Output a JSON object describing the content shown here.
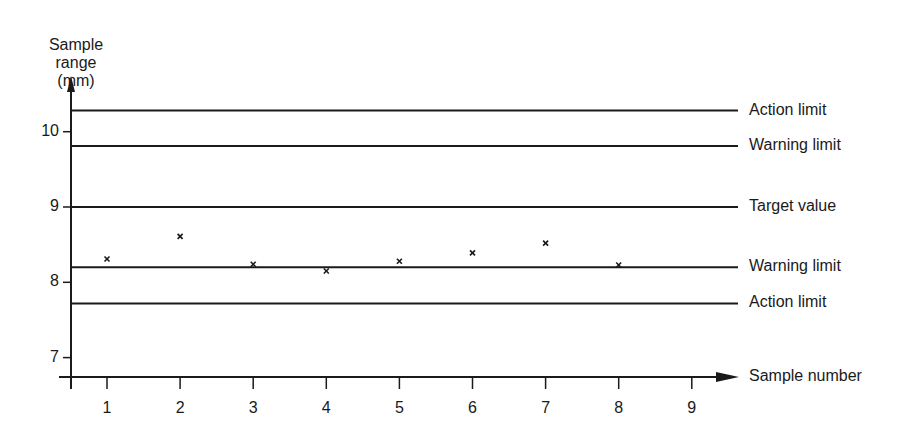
{
  "chart_data": {
    "type": "scatter",
    "title": "",
    "xlabel": "Sample number",
    "ylabel": "Sample range (mm)",
    "ylabel_lines": [
      "Sample",
      "range (mm)"
    ],
    "x": [
      1,
      2,
      3,
      4,
      5,
      6,
      7,
      8
    ],
    "values": [
      8.31,
      8.61,
      8.24,
      8.15,
      8.28,
      8.39,
      8.52,
      8.23
    ],
    "x_ticks": [
      "1",
      "2",
      "3",
      "4",
      "5",
      "6",
      "7",
      "8",
      "9"
    ],
    "y_ticks": [
      "7",
      "8",
      "9",
      "10"
    ],
    "xlim": [
      0.5,
      9.7
    ],
    "ylim": [
      6.75,
      10.7
    ],
    "grid": false,
    "marker": "x",
    "reference_lines": [
      {
        "label": "Action limit",
        "value": 10.28
      },
      {
        "label": "Warning limit",
        "value": 9.81
      },
      {
        "label": "Target value",
        "value": 9.0
      },
      {
        "label": "Warning limit",
        "value": 8.2
      },
      {
        "label": "Action limit",
        "value": 7.72
      }
    ]
  },
  "colors": {
    "ink": "#1a1a1a",
    "background": "#ffffff"
  }
}
